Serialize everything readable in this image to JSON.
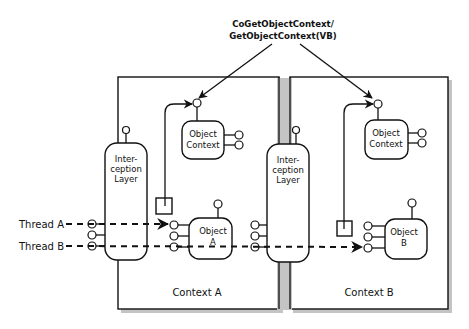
{
  "diagram": {
    "title_line1": "CoGetObjectContext/",
    "title_line2": "GetObjectContext(VB)",
    "threads": [
      {
        "label": "Thread A"
      },
      {
        "label": "Thread B"
      }
    ],
    "contexts": [
      {
        "label": "Context A",
        "interception_layer": [
          "Inter-",
          "ception",
          "Layer"
        ],
        "object_context": [
          "Object",
          "Context"
        ],
        "object": [
          "Object",
          "A"
        ]
      },
      {
        "label": "Context B",
        "interception_layer": [
          "Inter-",
          "ception",
          "Layer"
        ],
        "object_context": [
          "Object",
          "Context"
        ],
        "object": [
          "Object",
          "B"
        ]
      }
    ],
    "colors": {
      "line": "#111111",
      "shadow": "#b8b8b8",
      "background": "#ffffff"
    }
  }
}
